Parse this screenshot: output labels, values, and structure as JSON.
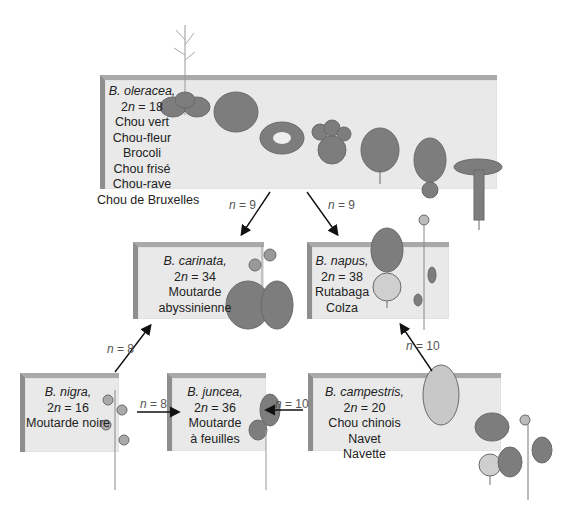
{
  "species": [
    {
      "id": "oleracea",
      "name": "B. oleracea,",
      "chromosomes": "2n = 18",
      "n_sym": "n",
      "common": [
        "Chou vert",
        "Chou-fleur",
        "Brocoli",
        "Chou frisé",
        "Chou-rave",
        "Chou de Bruxelles"
      ]
    },
    {
      "id": "carinata",
      "name": "B. carinata,",
      "chromosomes": "2n = 34",
      "common": [
        "Moutarde",
        "abyssinienne"
      ]
    },
    {
      "id": "napus",
      "name": "B. napus,",
      "chromosomes": "2n = 38",
      "common": [
        "Rutabaga",
        "Colza"
      ]
    },
    {
      "id": "nigra",
      "name": "B. nigra,",
      "chromosomes": "2n = 16",
      "common": [
        "Moutarde noire"
      ]
    },
    {
      "id": "juncea",
      "name": "B. juncea,",
      "chromosomes": "2n = 36",
      "common": [
        "Moutarde",
        "à feuilles"
      ]
    },
    {
      "id": "campestris",
      "name": "B. campestris,",
      "chromosomes": "2n = 20",
      "common": [
        "Chou chinois",
        "Navet",
        "Navette"
      ]
    }
  ],
  "arrows": [
    {
      "from": "oleracea",
      "to": "carinata",
      "label": "n = 9"
    },
    {
      "from": "oleracea",
      "to": "napus",
      "label": "n = 9"
    },
    {
      "from": "nigra",
      "to": "carinata",
      "label": "n = 8"
    },
    {
      "from": "nigra",
      "to": "juncea",
      "label": "n = 8"
    },
    {
      "from": "campestris",
      "to": "juncea",
      "label": "n = 10"
    },
    {
      "from": "campestris",
      "to": "napus",
      "label": "n = 10"
    }
  ],
  "colors": {
    "box": "#e9e9e9",
    "box_edge": "#8e8e8e",
    "plant": "#7a7a7a",
    "arrow": "#111111"
  }
}
